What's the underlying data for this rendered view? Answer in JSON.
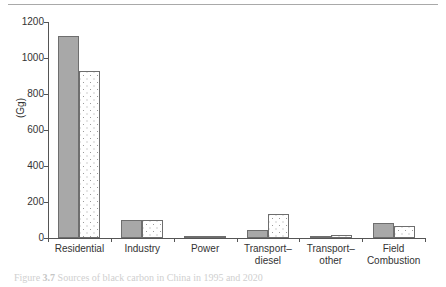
{
  "figure": {
    "caption_prefix": "Figure",
    "caption_number": "3.7",
    "caption_text": "Sources of black carbon in China in 1995 and 2020"
  },
  "chart_data": {
    "type": "bar",
    "title": "",
    "xlabel": "",
    "ylabel": "(Gg)",
    "ylim": [
      0,
      1200
    ],
    "yticks": [
      0,
      200,
      400,
      600,
      800,
      1000,
      1200
    ],
    "ytick_labels": [
      "0",
      "200",
      "400",
      "600",
      "800",
      "1000",
      "1200"
    ],
    "grid": false,
    "legend": "none",
    "categories": [
      "Residential",
      "Industry",
      "Power",
      "Transport–diesel",
      "Transport–other",
      "Field Combustion"
    ],
    "category_labels": [
      "Residential",
      "Industry",
      "Power",
      "Transport–\ndiesel",
      "Transport–\nother",
      "Field\nCombustion"
    ],
    "series": [
      {
        "name": "1995",
        "style": "solid-gray",
        "color": "#a8a8a8",
        "values": [
          1120,
          100,
          10,
          42,
          10,
          85
        ]
      },
      {
        "name": "2020",
        "style": "white-dotted",
        "color": "#ffffff",
        "values": [
          930,
          100,
          8,
          133,
          16,
          67
        ]
      }
    ]
  },
  "colors": {
    "bar_solid": "#a8a8a8",
    "bar_dotted_fill": "#ffffff",
    "bar_dot": "#9a9a9a",
    "bar_border": "#6e6e6e",
    "axis": "#555555",
    "rule": "#a9a9a9",
    "text": "#333333"
  }
}
